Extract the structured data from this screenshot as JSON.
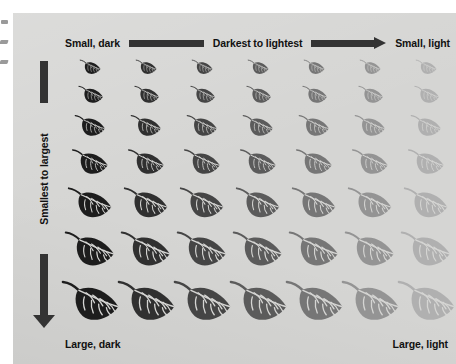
{
  "figure": {
    "type": "bivariate-symbol-legend",
    "background_color": "#d5d5d3",
    "ink_color": "#333333",
    "text_color": "#111111",
    "symbol": "leaf",
    "grid": {
      "rows": 7,
      "columns": 7
    }
  },
  "top_axis": {
    "start_label": "Small, dark",
    "middle_label": "Darkest to lightest",
    "end_label": "Small, light",
    "bar_name": "rule-bar",
    "arrow_name": "right-arrow"
  },
  "left_axis": {
    "label": "Smallest to largest",
    "bar_name": "rule-bar",
    "arrow_name": "down-arrow"
  },
  "bottom_axis": {
    "start_label": "Large, dark",
    "end_label": "Large, light"
  },
  "chart_data": {
    "type": "heatmap",
    "title": "",
    "xlabel": "Darkest to lightest",
    "ylabel": "Smallest to largest",
    "x_categories": [
      "col-1",
      "col-2",
      "col-3",
      "col-4",
      "col-5",
      "col-6",
      "col-7"
    ],
    "y_categories": [
      "row-1",
      "row-2",
      "row-3",
      "row-4",
      "row-5",
      "row-6",
      "row-7"
    ],
    "corner_labels": {
      "top_left": "Small, dark",
      "top_right": "Small, light",
      "bottom_left": "Large, dark",
      "bottom_right": "Large, light"
    },
    "legend": "none",
    "grid": false,
    "column_fill_colors": [
      "#1d1d1d",
      "#303030",
      "#454545",
      "#5b5b5b",
      "#767676",
      "#949494",
      "#b0b0b0"
    ],
    "row_symbol_widths": [
      18,
      22,
      27,
      32,
      38,
      44,
      50
    ],
    "row_symbol_heights": [
      11,
      13,
      16,
      19,
      23,
      26,
      30
    ],
    "cells": [
      {
        "row": 1,
        "values": [
          {
            "col": 1,
            "fill": "#1d1d1d",
            "width": 18,
            "height": 11
          },
          {
            "col": 2,
            "fill": "#303030",
            "width": 18,
            "height": 11
          },
          {
            "col": 3,
            "fill": "#454545",
            "width": 18,
            "height": 11
          },
          {
            "col": 4,
            "fill": "#5b5b5b",
            "width": 18,
            "height": 11
          },
          {
            "col": 5,
            "fill": "#767676",
            "width": 18,
            "height": 11
          },
          {
            "col": 6,
            "fill": "#949494",
            "width": 18,
            "height": 11
          },
          {
            "col": 7,
            "fill": "#b0b0b0",
            "width": 18,
            "height": 11
          }
        ]
      },
      {
        "row": 2,
        "values": [
          {
            "col": 1,
            "fill": "#1d1d1d",
            "width": 22,
            "height": 13
          },
          {
            "col": 2,
            "fill": "#303030",
            "width": 22,
            "height": 13
          },
          {
            "col": 3,
            "fill": "#454545",
            "width": 22,
            "height": 13
          },
          {
            "col": 4,
            "fill": "#5b5b5b",
            "width": 22,
            "height": 13
          },
          {
            "col": 5,
            "fill": "#767676",
            "width": 22,
            "height": 13
          },
          {
            "col": 6,
            "fill": "#949494",
            "width": 22,
            "height": 13
          },
          {
            "col": 7,
            "fill": "#b0b0b0",
            "width": 22,
            "height": 13
          }
        ]
      },
      {
        "row": 3,
        "values": [
          {
            "col": 1,
            "fill": "#1d1d1d",
            "width": 27,
            "height": 16
          },
          {
            "col": 2,
            "fill": "#303030",
            "width": 27,
            "height": 16
          },
          {
            "col": 3,
            "fill": "#454545",
            "width": 27,
            "height": 16
          },
          {
            "col": 4,
            "fill": "#5b5b5b",
            "width": 27,
            "height": 16
          },
          {
            "col": 5,
            "fill": "#767676",
            "width": 27,
            "height": 16
          },
          {
            "col": 6,
            "fill": "#949494",
            "width": 27,
            "height": 16
          },
          {
            "col": 7,
            "fill": "#b0b0b0",
            "width": 27,
            "height": 16
          }
        ]
      },
      {
        "row": 4,
        "values": [
          {
            "col": 1,
            "fill": "#1d1d1d",
            "width": 32,
            "height": 19
          },
          {
            "col": 2,
            "fill": "#303030",
            "width": 32,
            "height": 19
          },
          {
            "col": 3,
            "fill": "#454545",
            "width": 32,
            "height": 19
          },
          {
            "col": 4,
            "fill": "#5b5b5b",
            "width": 32,
            "height": 19
          },
          {
            "col": 5,
            "fill": "#767676",
            "width": 32,
            "height": 19
          },
          {
            "col": 6,
            "fill": "#949494",
            "width": 32,
            "height": 19
          },
          {
            "col": 7,
            "fill": "#b0b0b0",
            "width": 32,
            "height": 19
          }
        ]
      },
      {
        "row": 5,
        "values": [
          {
            "col": 1,
            "fill": "#1d1d1d",
            "width": 38,
            "height": 23
          },
          {
            "col": 2,
            "fill": "#303030",
            "width": 38,
            "height": 23
          },
          {
            "col": 3,
            "fill": "#454545",
            "width": 38,
            "height": 23
          },
          {
            "col": 4,
            "fill": "#5b5b5b",
            "width": 38,
            "height": 23
          },
          {
            "col": 5,
            "fill": "#767676",
            "width": 38,
            "height": 23
          },
          {
            "col": 6,
            "fill": "#949494",
            "width": 38,
            "height": 23
          },
          {
            "col": 7,
            "fill": "#b0b0b0",
            "width": 38,
            "height": 23
          }
        ]
      },
      {
        "row": 6,
        "values": [
          {
            "col": 1,
            "fill": "#1d1d1d",
            "width": 44,
            "height": 26
          },
          {
            "col": 2,
            "fill": "#303030",
            "width": 44,
            "height": 26
          },
          {
            "col": 3,
            "fill": "#454545",
            "width": 44,
            "height": 26
          },
          {
            "col": 4,
            "fill": "#5b5b5b",
            "width": 44,
            "height": 26
          },
          {
            "col": 5,
            "fill": "#767676",
            "width": 44,
            "height": 26
          },
          {
            "col": 6,
            "fill": "#949494",
            "width": 44,
            "height": 26
          },
          {
            "col": 7,
            "fill": "#b0b0b0",
            "width": 44,
            "height": 26
          }
        ]
      },
      {
        "row": 7,
        "values": [
          {
            "col": 1,
            "fill": "#1d1d1d",
            "width": 50,
            "height": 30
          },
          {
            "col": 2,
            "fill": "#303030",
            "width": 50,
            "height": 30
          },
          {
            "col": 3,
            "fill": "#454545",
            "width": 50,
            "height": 30
          },
          {
            "col": 4,
            "fill": "#5b5b5b",
            "width": 50,
            "height": 30
          },
          {
            "col": 5,
            "fill": "#767676",
            "width": 50,
            "height": 30
          },
          {
            "col": 6,
            "fill": "#949494",
            "width": 50,
            "height": 30
          },
          {
            "col": 7,
            "fill": "#b0b0b0",
            "width": 50,
            "height": 30
          }
        ]
      }
    ]
  }
}
